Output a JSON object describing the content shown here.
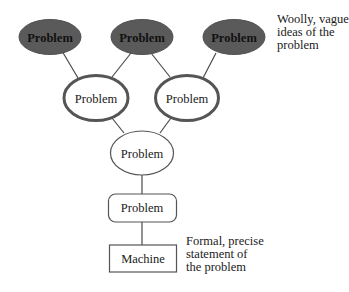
{
  "diagram": {
    "type": "hierarchy",
    "colors": {
      "vague_fill": "#5a5a5a",
      "vague_stroke": "#505050",
      "mid_stroke": "#555555",
      "line": "#4a4a4a",
      "text": "#1a1a1a"
    },
    "levels": [
      {
        "name": "vague",
        "nodes": [
          {
            "id": "v1",
            "label": "Problem",
            "shape": "ellipse-filled"
          },
          {
            "id": "v2",
            "label": "Problem",
            "shape": "ellipse-filled"
          },
          {
            "id": "v3",
            "label": "Problem",
            "shape": "ellipse-filled"
          }
        ]
      },
      {
        "name": "intermediate",
        "nodes": [
          {
            "id": "m1",
            "label": "Problem",
            "shape": "ellipse-thick"
          },
          {
            "id": "m2",
            "label": "Problem",
            "shape": "ellipse-thick"
          }
        ]
      },
      {
        "name": "refined",
        "nodes": [
          {
            "id": "r1",
            "label": "Problem",
            "shape": "ellipse-thin"
          }
        ]
      },
      {
        "name": "structured",
        "nodes": [
          {
            "id": "s1",
            "label": "Problem",
            "shape": "rounded-rect"
          }
        ]
      },
      {
        "name": "formal",
        "nodes": [
          {
            "id": "f1",
            "label": "Machine",
            "shape": "rect"
          }
        ]
      }
    ],
    "edges": [
      [
        "v1",
        "m1"
      ],
      [
        "v2",
        "m1"
      ],
      [
        "v2",
        "m2"
      ],
      [
        "v3",
        "m2"
      ],
      [
        "m1",
        "r1"
      ],
      [
        "m2",
        "r1"
      ],
      [
        "r1",
        "s1"
      ],
      [
        "s1",
        "f1"
      ]
    ],
    "annotations": {
      "top": [
        "Woolly, vague",
        "ideas of the",
        "problem"
      ],
      "bottom": [
        "Formal, precise",
        "statement of",
        "the problem"
      ]
    }
  }
}
